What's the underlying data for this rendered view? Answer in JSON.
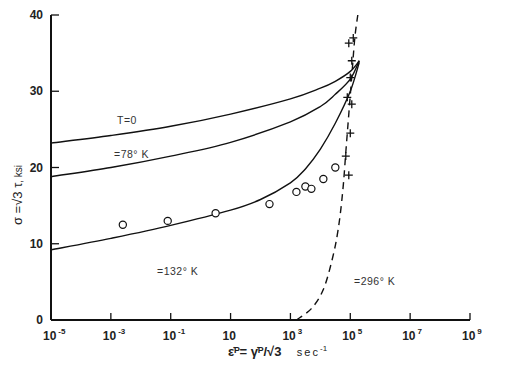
{
  "chart_data": {
    "type": "line",
    "title": "",
    "xlabel": "ε̇ᴾ = γ̇ᴾ/√3  sec⁻¹",
    "ylabel": "σ = √3 τ, ksi",
    "xscale": "log",
    "xlim_log10": [
      -5,
      9
    ],
    "ylim": [
      0,
      40
    ],
    "grid": false,
    "legend_position": "none (inline curve labels)",
    "x_ticks": [
      {
        "log": -5,
        "base": "10",
        "exp": "-5"
      },
      {
        "log": -3,
        "base": "10",
        "exp": "-3"
      },
      {
        "log": -1,
        "base": "10",
        "exp": "-1"
      },
      {
        "log": 1,
        "base": "10",
        "exp": ""
      },
      {
        "log": 3,
        "base": "10",
        "exp": "3"
      },
      {
        "log": 5,
        "base": "10",
        "exp": "5"
      },
      {
        "log": 7,
        "base": "10",
        "exp": "7"
      },
      {
        "log": 9,
        "base": "10",
        "exp": "9"
      }
    ],
    "y_ticks": [
      0,
      10,
      20,
      30,
      40
    ],
    "series": [
      {
        "name": "T=0",
        "label": "T=0",
        "style": "solid",
        "log_x": [
          -5,
          -3,
          -1,
          1,
          3,
          4,
          4.5,
          5,
          5.3
        ],
        "y": [
          23.2,
          24.2,
          25.4,
          27.0,
          29.0,
          30.4,
          31.3,
          32.6,
          34.0
        ]
      },
      {
        "name": "78 K",
        "label": "=78° K",
        "style": "solid",
        "log_x": [
          -5,
          -3,
          -1,
          1,
          3,
          4,
          4.5,
          5,
          5.3
        ],
        "y": [
          18.8,
          20.0,
          21.5,
          23.3,
          26.0,
          28.0,
          29.6,
          31.6,
          34.0
        ]
      },
      {
        "name": "132 K",
        "label": "=132° K",
        "style": "solid",
        "log_x": [
          -5,
          -3,
          -1,
          1,
          2,
          3,
          3.5,
          4,
          4.5,
          5,
          5.3
        ],
        "y": [
          9.2,
          10.7,
          12.4,
          14.4,
          15.8,
          18.0,
          19.8,
          22.4,
          25.8,
          30.0,
          33.8
        ]
      },
      {
        "name": "296 K",
        "label": "=296° K",
        "style": "dashed",
        "log_x": [
          3.2,
          3.7,
          4.1,
          4.4,
          4.6,
          4.75,
          4.85,
          4.95,
          5.05,
          5.15,
          5.25
        ],
        "y": [
          0,
          1.5,
          4,
          8,
          12,
          17,
          22,
          27,
          32,
          37,
          40
        ]
      }
    ],
    "markers": [
      {
        "name": "132 K data",
        "symbol": "circle",
        "points": [
          [
            -2.6,
            12.5
          ],
          [
            -1.1,
            13.0
          ],
          [
            0.5,
            14.0
          ],
          [
            2.3,
            15.2
          ],
          [
            3.2,
            16.8
          ],
          [
            3.5,
            17.5
          ],
          [
            3.7,
            17.2
          ],
          [
            4.1,
            18.5
          ],
          [
            4.5,
            20.0
          ]
        ]
      },
      {
        "name": "296 K data",
        "symbol": "plus",
        "points": [
          [
            4.95,
            36.3
          ],
          [
            5.1,
            37.0
          ],
          [
            5.05,
            34.0
          ],
          [
            5.0,
            31.8
          ],
          [
            4.9,
            29.2
          ],
          [
            5.05,
            28.3
          ],
          [
            5.0,
            24.5
          ],
          [
            4.85,
            21.5
          ],
          [
            4.95,
            19.0
          ]
        ]
      }
    ]
  },
  "labels": {
    "curve_t0": "T=0",
    "curve_78": "=78° K",
    "curve_132": "=132° K",
    "curve_296": "=296° K",
    "y_title_main": "σ =√3 τ",
    "y_title_unit": ", ksi",
    "x_title_main": "ε̇ᴾ= γ̇ᴾ/√3",
    "x_title_unit": "sec",
    "x_title_exp": "-1"
  }
}
